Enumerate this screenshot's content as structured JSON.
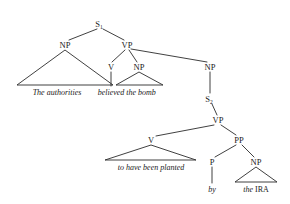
{
  "figure": {
    "type": "syntax-tree",
    "title": "",
    "background_color": "#ffffff",
    "line_color": "#2b2b2b",
    "text_color": "#1a1a1a"
  },
  "nodes": {
    "s1": {
      "label": "S",
      "subscript": "1",
      "x": 100,
      "y": 24
    },
    "np_subject": {
      "label": "NP",
      "subscript": "",
      "x": 65,
      "y": 45
    },
    "vp_main": {
      "label": "VP",
      "subscript": "",
      "x": 127,
      "y": 45
    },
    "v_main": {
      "label": "V",
      "subscript": "",
      "x": 111,
      "y": 67
    },
    "np_object": {
      "label": "NP",
      "subscript": "",
      "x": 139,
      "y": 67
    },
    "np_clause": {
      "label": "NP",
      "subscript": "",
      "x": 210,
      "y": 67
    },
    "s2": {
      "label": "S",
      "subscript": "2",
      "x": 210,
      "y": 99
    },
    "vp_embedded": {
      "label": "VP",
      "subscript": "",
      "x": 218,
      "y": 120
    },
    "v_embedded": {
      "label": "V",
      "subscript": "",
      "x": 151,
      "y": 140
    },
    "pp": {
      "label": "PP",
      "subscript": "",
      "x": 239,
      "y": 140
    },
    "p": {
      "label": "P",
      "subscript": "",
      "x": 212,
      "y": 162
    },
    "np_agent": {
      "label": "NP",
      "subscript": "",
      "x": 256,
      "y": 162
    }
  },
  "terminals": {
    "subject_phrase": {
      "text": "The authorities",
      "style": "italic",
      "x": 57,
      "y": 95
    },
    "main_verb": {
      "text": "believed",
      "style": "italic",
      "x": 111,
      "y": 95
    },
    "object_phrase": {
      "text": "the bomb",
      "style": "italic",
      "x": 140,
      "y": 95
    },
    "embedded_verb_phrase": {
      "text": "to have been planted",
      "style": "italic",
      "x": 151,
      "y": 170
    },
    "preposition": {
      "text": "by",
      "style": "italic",
      "x": 212,
      "y": 192
    },
    "agent_determiner": {
      "text": "the",
      "style": "italic",
      "x": 243,
      "y": 192
    },
    "agent_noun": {
      "text": "IRA",
      "style": "roman",
      "x": 263,
      "y": 192
    }
  },
  "triangles": [
    {
      "name": "np-subject-triangle",
      "apex_x": 65,
      "apex_y": 50,
      "left_x": 17,
      "right_x": 113,
      "base_y": 85
    },
    {
      "name": "np-object-triangle",
      "apex_x": 139,
      "apex_y": 72,
      "left_x": 116,
      "right_x": 163,
      "base_y": 85
    },
    {
      "name": "v-embedded-triangle",
      "apex_x": 151,
      "apex_y": 145,
      "left_x": 105,
      "right_x": 196,
      "base_y": 160
    },
    {
      "name": "np-agent-triangle",
      "apex_x": 256,
      "apex_y": 167,
      "left_x": 235,
      "right_x": 277,
      "base_y": 182
    }
  ],
  "branches": [
    {
      "name": "s1-to-np-subject",
      "x1": 97,
      "y1": 29,
      "x2": 69,
      "y2": 40
    },
    {
      "name": "s1-to-vp-main",
      "x1": 103,
      "y1": 29,
      "x2": 124,
      "y2": 40
    },
    {
      "name": "vp-main-to-v",
      "x1": 125,
      "y1": 50,
      "x2": 112,
      "y2": 62
    },
    {
      "name": "vp-main-to-np-object",
      "x1": 129,
      "y1": 50,
      "x2": 137,
      "y2": 62
    },
    {
      "name": "vp-main-to-np-clause",
      "x1": 131,
      "y1": 49,
      "x2": 207,
      "y2": 62
    },
    {
      "name": "v-main-to-terminal",
      "x1": 111,
      "y1": 72,
      "x2": 111,
      "y2": 86
    },
    {
      "name": "np-clause-to-s2",
      "x1": 210,
      "y1": 72,
      "x2": 210,
      "y2": 93
    },
    {
      "name": "s2-to-vp-embedded",
      "x1": 212,
      "y1": 104,
      "x2": 217,
      "y2": 115
    },
    {
      "name": "vp-embedded-to-v",
      "x1": 214,
      "y1": 125,
      "x2": 156,
      "y2": 136
    },
    {
      "name": "vp-embedded-to-pp",
      "x1": 221,
      "y1": 125,
      "x2": 236,
      "y2": 135
    },
    {
      "name": "pp-to-p",
      "x1": 236,
      "y1": 145,
      "x2": 215,
      "y2": 157
    },
    {
      "name": "pp-to-np-agent",
      "x1": 242,
      "y1": 145,
      "x2": 254,
      "y2": 157
    },
    {
      "name": "p-to-terminal",
      "x1": 212,
      "y1": 167,
      "x2": 212,
      "y2": 183
    }
  ]
}
